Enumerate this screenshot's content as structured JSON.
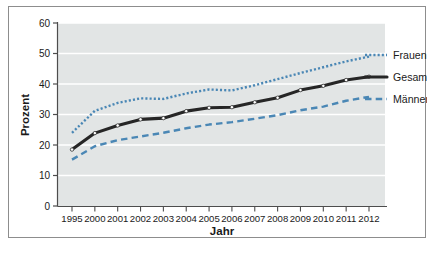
{
  "chart_data": {
    "type": "line",
    "title": "",
    "xlabel": "Jahr",
    "ylabel": "Prozent",
    "categories": [
      "1995",
      "2000",
      "2001",
      "2002",
      "2003",
      "2004",
      "2005",
      "2006",
      "2007",
      "2008",
      "2009",
      "2010",
      "2011",
      "2012"
    ],
    "x_tick_labels": [
      "1995",
      "2000",
      "2001",
      "2002",
      "2003",
      "2004",
      "2005",
      "2006",
      "2007",
      "2008",
      "2009",
      "2010",
      "2011",
      "2012"
    ],
    "y_tick_labels": [
      "0",
      "10",
      "20",
      "30",
      "40",
      "50",
      "60"
    ],
    "y_ticks": [
      0,
      10,
      20,
      30,
      40,
      50,
      60
    ],
    "ylim": [
      0,
      60
    ],
    "grid": true,
    "grid_color": "#ffffff",
    "plot_background": "#e2e5e5",
    "legend_position": "right",
    "series": [
      {
        "name": "Frauen",
        "style": "dotted",
        "color": "#4a87b5",
        "values": [
          24.0,
          31.2,
          33.8,
          35.3,
          35.1,
          36.9,
          38.2,
          37.9,
          39.6,
          41.6,
          43.6,
          45.5,
          47.4,
          49.0
        ]
      },
      {
        "name": "Gesamt",
        "style": "solid",
        "color": "#262626",
        "marker": "circle",
        "values": [
          18.5,
          23.9,
          26.4,
          28.4,
          28.8,
          31.1,
          32.2,
          32.4,
          34.0,
          35.5,
          38.0,
          39.4,
          41.3,
          42.4
        ]
      },
      {
        "name": "Männer",
        "style": "dashed",
        "color": "#4a87b5",
        "values": [
          15.2,
          19.6,
          21.6,
          22.8,
          24.0,
          25.5,
          26.7,
          27.5,
          28.6,
          29.8,
          31.4,
          32.6,
          34.5,
          35.8
        ]
      }
    ]
  },
  "legend": {
    "items": [
      {
        "label": "Frauen",
        "style": "dotted",
        "color": "#4a87b5"
      },
      {
        "label": "Gesamt",
        "style": "solid",
        "color": "#262626"
      },
      {
        "label": "Männer",
        "style": "dashed",
        "color": "#4a87b5"
      }
    ]
  },
  "axes": {
    "y_title": "Prozent",
    "x_title": "Jahr"
  },
  "colors": {
    "accent_blue": "#4a87b5",
    "line_dark": "#262626",
    "plot_bg": "#e2e5e5",
    "grid": "#ffffff",
    "frame_border": "#8d8d8d",
    "axis": "#4d4d4d"
  }
}
